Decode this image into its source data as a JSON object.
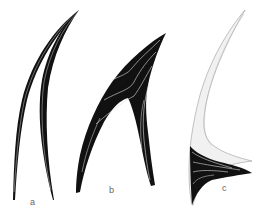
{
  "figure": {
    "panels": [
      {
        "id": "a",
        "label": "a",
        "description": "two slender curved black spines converging at a tip"
      },
      {
        "id": "b",
        "label": "b",
        "description": "black inverted-V curved shape with white inner contour lines"
      },
      {
        "id": "c",
        "label": "c",
        "description": "light stippled crescent with black triangular base showing white growth lines"
      }
    ],
    "colors": {
      "background": "#ffffff",
      "ink": "#111111",
      "stipple": "#ededed",
      "outline": "#9a9a9a",
      "contour": "#dddddd",
      "label": "#666666"
    }
  }
}
